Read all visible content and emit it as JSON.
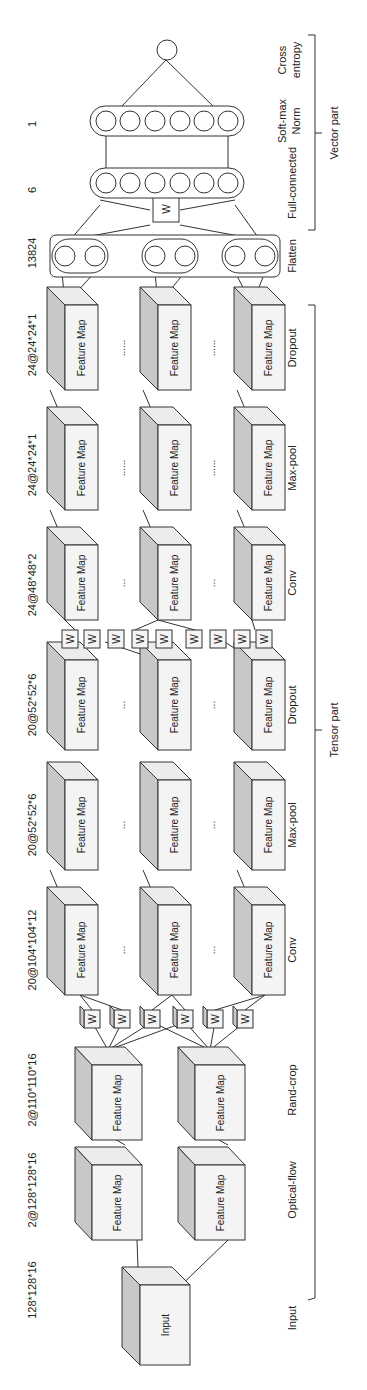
{
  "diagram": {
    "orientation": "rotated -90deg (reads bottom-to-top)",
    "dimensions": [
      "128*128*16",
      "2@128*128*16",
      "2@110*110*16",
      "20@104*104*12",
      "20@52*52*6",
      "20@52*52*6",
      "24@48*48*2",
      "24@24*24*1",
      "24@24*24*1",
      "13824",
      "6",
      "1"
    ],
    "layers": [
      "Input",
      "Optical-flow",
      "Rand-crop",
      "Conv",
      "Max-pool",
      "Dropout",
      "Conv",
      "Max-pool",
      "Dropout",
      "Flatten",
      "Full-connected",
      "Soft-max Norm",
      "Cross entropy"
    ],
    "layer_lines": {
      "softmax_1": "Soft-max",
      "softmax_2": "Norm",
      "cross_1": "Cross",
      "cross_2": "entropy"
    },
    "cube_labels": {
      "input": "Input",
      "feature_map": "Feature Map"
    },
    "weight_label": "W",
    "ellipsis_short": "...",
    "ellipsis_long": "......",
    "flatten_ellipsis": "...",
    "groups": {
      "tensor_part": "Tensor part",
      "vector_part": "Vector part"
    },
    "fc_neurons": 6,
    "softmax_neurons": 6
  }
}
